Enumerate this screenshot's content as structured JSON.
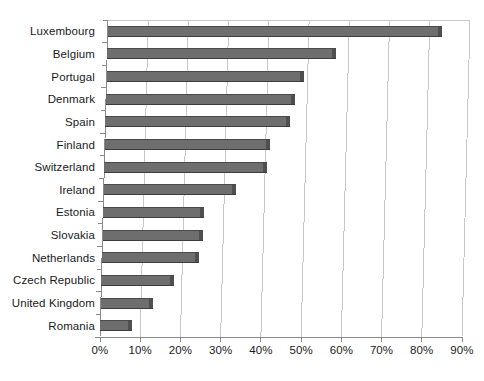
{
  "chart_data": {
    "type": "bar",
    "orientation": "horizontal",
    "title": "",
    "subtitle": "",
    "xlabel": "",
    "ylabel": "",
    "grid": true,
    "legend": "none",
    "xlim": [
      0,
      90
    ],
    "xtick_labels": [
      "0%",
      "10%",
      "20%",
      "30%",
      "40%",
      "50%",
      "60%",
      "70%",
      "80%",
      "90%"
    ],
    "xtick_values": [
      0,
      10,
      20,
      30,
      40,
      50,
      60,
      70,
      80,
      90
    ],
    "categories": [
      "Luxembourg",
      "Belgium",
      "Portugal",
      "Denmark",
      "Spain",
      "Finland",
      "Switzerland",
      "Ireland",
      "Estonia",
      "Slovakia",
      "Netherlands",
      "Czech Republic",
      "United Kingdom",
      "Romania"
    ],
    "values": [
      83,
      57,
      49,
      47,
      46,
      41,
      40.5,
      33,
      25,
      25,
      24,
      18,
      13,
      8
    ],
    "series": [
      {
        "name": "share",
        "values": [
          83,
          57,
          49,
          47,
          46,
          41,
          40.5,
          33,
          25,
          25,
          24,
          18,
          13,
          8
        ]
      }
    ],
    "bar_color": "#6e6e6e",
    "bar_edge_color": "#3d3d3d",
    "grid_color": "#c8c8c8",
    "axis_color": "#8a8a8a",
    "text_color": "#1a1a1a",
    "style_note": "3d-skewed-plot-frame"
  },
  "footer": {
    "note": ""
  }
}
